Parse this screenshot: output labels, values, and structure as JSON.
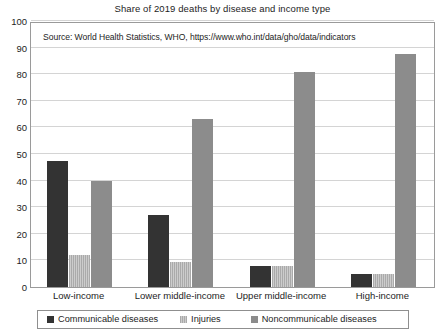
{
  "chart_data": {
    "type": "bar",
    "title": "Share of 2019 deaths by disease and income type",
    "subtitle": "",
    "annotation": "Source: World Health Statistics, WHO, https://www.who.int/data/gho/data/indicators",
    "xlabel": "",
    "ylabel": "",
    "ylim": [
      0,
      100
    ],
    "yticks": [
      0,
      10,
      20,
      30,
      40,
      50,
      60,
      70,
      80,
      90,
      100
    ],
    "ytick_labels": [
      "0",
      "10",
      "20",
      "30",
      "40",
      "50",
      "60",
      "70",
      "80",
      "90",
      "100"
    ],
    "grid": true,
    "legend_position": "bottom",
    "categories": [
      "Low-income",
      "Lower middle-income",
      "Upper middle-income",
      "High-income"
    ],
    "series": [
      {
        "name": "Communicable diseases",
        "color": "#333333",
        "values": [
          47.5,
          27,
          8,
          5
        ]
      },
      {
        "name": "Injuries",
        "color": "#b8b8b8",
        "values": [
          12,
          9.5,
          8,
          5
        ]
      },
      {
        "name": "Noncommunicable diseases",
        "color": "#8c8c8c",
        "values": [
          40,
          63,
          81,
          87.5
        ]
      }
    ]
  }
}
